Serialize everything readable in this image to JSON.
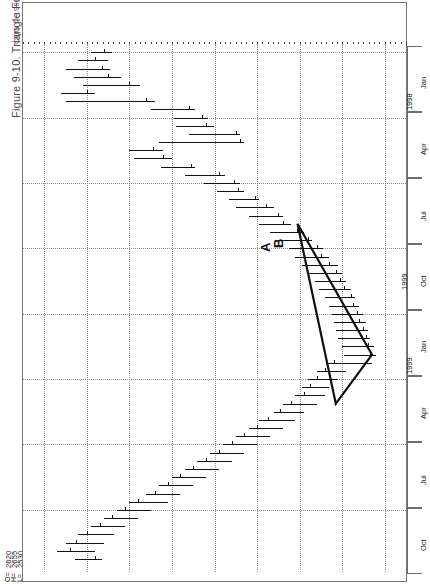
{
  "figure": {
    "caption": "Figure 9-10. Triangle Formation",
    "copyright": "CQG © 1999",
    "symbol_title": "CL - CRUDE LIGHT-PIT, WEEKLY",
    "timestamp_footer": "THURSDAY, DECEMBER 30, 1999 09:37AM (VER: 2.589-0)"
  },
  "quote": {
    "rows": [
      {
        "label": "O=",
        "value": "2620"
      },
      {
        "label": "H=",
        "value": "2655"
      },
      {
        "label": "L=",
        "value": "2530"
      },
      {
        "label": "C=",
        "value": "2560✓"
      },
      {
        "label": "Δ=",
        "value": "-87"
      }
    ]
  },
  "price_axis": {
    "highlight_value": "2560",
    "labels": [
      "2800",
      "2400",
      "2200",
      "2000",
      "1800",
      "1600",
      "1400",
      "1200"
    ]
  },
  "date_axis": {
    "years": [
      "1998",
      "1999"
    ],
    "cells": [
      "Jan",
      "Apr",
      "Jul",
      "Oct",
      "Jan",
      "Apr",
      "Jul",
      "Oct"
    ]
  },
  "annotations": {
    "point_a": "A",
    "point_b": "B",
    "year_marker": "1999"
  },
  "chart_data": {
    "type": "bar",
    "title": "CL - CRUDE LIGHT-PIT, WEEKLY",
    "subtitle": "Figure 9-10. Triangle Formation",
    "xlabel": "Date (weekly)",
    "ylabel": "Price",
    "ylim": [
      1100,
      2900
    ],
    "yticks": [
      2800,
      2600,
      2400,
      2200,
      2000,
      1800,
      1600,
      1400,
      1200
    ],
    "grid": true,
    "legend": "none",
    "orientation": "rotated-90ccw",
    "last_quote": {
      "open": 2620,
      "high": 2655,
      "low": 2530,
      "close": 2560,
      "change": -87
    },
    "annotations": [
      {
        "label": "A",
        "note": "first contact point of triangle"
      },
      {
        "label": "B",
        "note": "second contact point of triangle"
      },
      {
        "label": "1999",
        "note": "year divider on date axis"
      },
      {
        "type": "triangle",
        "note": "symmetrical triangle formation drawn over consolidation into 1999 low"
      }
    ],
    "series": [
      {
        "name": "Weekly OHLC bars",
        "bars": [
          {
            "i": 0,
            "high": 2580,
            "low": 2480,
            "close": 2520
          },
          {
            "i": 1,
            "high": 2640,
            "low": 2500,
            "close": 2560
          },
          {
            "i": 2,
            "high": 2700,
            "low": 2490,
            "close": 2530
          },
          {
            "i": 3,
            "high": 2660,
            "low": 2440,
            "close": 2500
          },
          {
            "i": 4,
            "high": 2620,
            "low": 2350,
            "close": 2400
          },
          {
            "i": 5,
            "high": 2720,
            "low": 2560,
            "close": 2600
          },
          {
            "i": 6,
            "high": 2700,
            "low": 2280,
            "close": 2320
          },
          {
            "i": 7,
            "high": 2300,
            "low": 2090,
            "close": 2120
          },
          {
            "i": 8,
            "high": 2190,
            "low": 2030,
            "close": 2060
          },
          {
            "i": 9,
            "high": 2180,
            "low": 2000,
            "close": 2040
          },
          {
            "i": 10,
            "high": 2120,
            "low": 1880,
            "close": 1900
          },
          {
            "i": 11,
            "high": 2260,
            "low": 1860,
            "close": 1880
          },
          {
            "i": 12,
            "high": 2400,
            "low": 2240,
            "close": 2290
          },
          {
            "i": 13,
            "high": 2380,
            "low": 2200,
            "close": 2240
          },
          {
            "i": 14,
            "high": 2250,
            "low": 2090,
            "close": 2110
          },
          {
            "i": 15,
            "high": 2140,
            "low": 1950,
            "close": 1980
          },
          {
            "i": 16,
            "high": 2050,
            "low": 1880,
            "close": 1910
          },
          {
            "i": 17,
            "high": 1990,
            "low": 1860,
            "close": 1890
          },
          {
            "i": 18,
            "high": 1930,
            "low": 1790,
            "close": 1810
          },
          {
            "i": 19,
            "high": 1900,
            "low": 1720,
            "close": 1760
          },
          {
            "i": 20,
            "high": 1840,
            "low": 1680,
            "close": 1700
          },
          {
            "i": 21,
            "high": 1790,
            "low": 1640,
            "close": 1680
          },
          {
            "i": 22,
            "high": 1740,
            "low": 1580,
            "close": 1610
          },
          {
            "i": 23,
            "high": 1700,
            "low": 1540,
            "close": 1560
          },
          {
            "i": 24,
            "high": 1650,
            "low": 1490,
            "close": 1520
          },
          {
            "i": 25,
            "high": 1620,
            "low": 1460,
            "close": 1500
          },
          {
            "i": 26,
            "high": 1590,
            "low": 1420,
            "close": 1460
          },
          {
            "i": 27,
            "high": 1560,
            "low": 1400,
            "close": 1430
          },
          {
            "i": 28,
            "high": 1530,
            "low": 1380,
            "close": 1410
          },
          {
            "i": 29,
            "high": 1510,
            "low": 1360,
            "close": 1390
          },
          {
            "i": 30,
            "high": 1480,
            "low": 1340,
            "close": 1360
          },
          {
            "i": 31,
            "high": 1460,
            "low": 1320,
            "close": 1350
          },
          {
            "i": 32,
            "high": 1450,
            "low": 1300,
            "close": 1330
          },
          {
            "i": 33,
            "high": 1440,
            "low": 1290,
            "close": 1320
          },
          {
            "i": 34,
            "high": 1430,
            "low": 1280,
            "close": 1300
          },
          {
            "i": 35,
            "high": 1420,
            "low": 1270,
            "close": 1290
          },
          {
            "i": 36,
            "high": 1400,
            "low": 1250,
            "close": 1280
          },
          {
            "i": 37,
            "high": 1390,
            "low": 1240,
            "close": 1270
          },
          {
            "i": 38,
            "high": 1470,
            "low": 1260,
            "close": 1440
          },
          {
            "i": 39,
            "high": 1520,
            "low": 1380,
            "close": 1480
          },
          {
            "i": 40,
            "high": 1560,
            "low": 1420,
            "close": 1520
          },
          {
            "i": 41,
            "high": 1590,
            "low": 1460,
            "close": 1550
          },
          {
            "i": 42,
            "high": 1620,
            "low": 1480,
            "close": 1580
          },
          {
            "i": 43,
            "high": 1680,
            "low": 1520,
            "close": 1640
          },
          {
            "i": 44,
            "high": 1720,
            "low": 1580,
            "close": 1690
          },
          {
            "i": 45,
            "high": 1790,
            "low": 1620,
            "close": 1750
          },
          {
            "i": 46,
            "high": 1840,
            "low": 1680,
            "close": 1800
          },
          {
            "i": 47,
            "high": 1900,
            "low": 1740,
            "close": 1860
          },
          {
            "i": 48,
            "high": 1960,
            "low": 1800,
            "close": 1920
          },
          {
            "i": 49,
            "high": 2020,
            "low": 1860,
            "close": 1980
          },
          {
            "i": 50,
            "high": 2080,
            "low": 1920,
            "close": 2040
          },
          {
            "i": 51,
            "high": 2140,
            "low": 1980,
            "close": 2100
          },
          {
            "i": 52,
            "high": 2200,
            "low": 2040,
            "close": 2160
          },
          {
            "i": 53,
            "high": 2260,
            "low": 2100,
            "close": 2220
          },
          {
            "i": 54,
            "high": 2320,
            "low": 2160,
            "close": 2280
          },
          {
            "i": 55,
            "high": 2400,
            "low": 2220,
            "close": 2360
          },
          {
            "i": 56,
            "high": 2460,
            "low": 2300,
            "close": 2420
          },
          {
            "i": 57,
            "high": 2520,
            "low": 2360,
            "close": 2480
          },
          {
            "i": 58,
            "high": 2580,
            "low": 2420,
            "close": 2540
          },
          {
            "i": 59,
            "high": 2640,
            "low": 2470,
            "close": 2600
          },
          {
            "i": 60,
            "high": 2700,
            "low": 2520,
            "close": 2650
          },
          {
            "i": 61,
            "high": 2740,
            "low": 2560,
            "close": 2680
          },
          {
            "i": 62,
            "high": 2655,
            "low": 2530,
            "close": 2560
          }
        ]
      }
    ]
  }
}
